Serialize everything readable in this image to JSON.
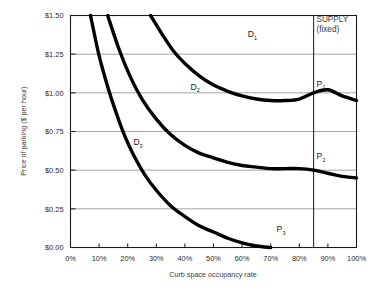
{
  "chart_data": {
    "type": "line",
    "title": "",
    "xlabel": "Curb space occupancy rate",
    "ylabel": "Price of parking ($ per hour)",
    "xlim": [
      0,
      100
    ],
    "ylim": [
      0.0,
      1.5
    ],
    "x_tick_labels": [
      "0%",
      "10%",
      "20%",
      "30%",
      "40%",
      "50%",
      "60%",
      "70%",
      "80%",
      "90%",
      "100%"
    ],
    "x_tick_values": [
      0,
      10,
      20,
      30,
      40,
      50,
      60,
      70,
      80,
      90,
      100
    ],
    "y_tick_labels": [
      "$0.00",
      "$0.25",
      "$0.50",
      "$0.75",
      "$1.00",
      "$1.25",
      "$1.50"
    ],
    "y_tick_values": [
      0.0,
      0.25,
      0.5,
      0.75,
      1.0,
      1.25,
      1.5
    ],
    "grid": true,
    "legend_position": "inline-labels",
    "series": [
      {
        "name": "D1",
        "label": "D",
        "subscript": "1",
        "label_x": 62,
        "label_y": 1.36,
        "points": [
          [
            28,
            1.5
          ],
          [
            32,
            1.38
          ],
          [
            36,
            1.27
          ],
          [
            40,
            1.19
          ],
          [
            45,
            1.11
          ],
          [
            50,
            1.05
          ],
          [
            55,
            1.01
          ],
          [
            60,
            0.98
          ],
          [
            65,
            0.96
          ],
          [
            70,
            0.95
          ],
          [
            75,
            0.95
          ],
          [
            80,
            0.96
          ],
          [
            85,
            1.0
          ],
          [
            90,
            1.02
          ],
          [
            95,
            0.98
          ],
          [
            100,
            0.95
          ]
        ]
      },
      {
        "name": "D2",
        "label": "D",
        "subscript": "2",
        "label_x": 42,
        "label_y": 1.02,
        "points": [
          [
            13,
            1.5
          ],
          [
            17,
            1.28
          ],
          [
            21,
            1.1
          ],
          [
            25,
            0.96
          ],
          [
            30,
            0.83
          ],
          [
            35,
            0.73
          ],
          [
            40,
            0.66
          ],
          [
            45,
            0.61
          ],
          [
            50,
            0.58
          ],
          [
            55,
            0.55
          ],
          [
            60,
            0.53
          ],
          [
            65,
            0.52
          ],
          [
            70,
            0.51
          ],
          [
            75,
            0.51
          ],
          [
            80,
            0.51
          ],
          [
            85,
            0.5
          ],
          [
            90,
            0.48
          ],
          [
            95,
            0.46
          ],
          [
            100,
            0.45
          ]
        ]
      },
      {
        "name": "D3",
        "label": "D",
        "subscript": "3",
        "label_x": 22,
        "label_y": 0.66,
        "points": [
          [
            7,
            1.5
          ],
          [
            10,
            1.24
          ],
          [
            13,
            1.04
          ],
          [
            16,
            0.87
          ],
          [
            19,
            0.72
          ],
          [
            22,
            0.6
          ],
          [
            26,
            0.47
          ],
          [
            30,
            0.37
          ],
          [
            35,
            0.27
          ],
          [
            40,
            0.2
          ],
          [
            45,
            0.14
          ],
          [
            50,
            0.1
          ],
          [
            55,
            0.06
          ],
          [
            60,
            0.03
          ],
          [
            65,
            0.01
          ],
          [
            70,
            0.0
          ]
        ]
      }
    ],
    "supply": {
      "label_line1": "SUPPLY",
      "label_line2": "(fixed)",
      "value": 85,
      "label_x": 86,
      "label_y": 1.46
    },
    "annotations": [
      {
        "name": "P1",
        "label": "P",
        "subscript": "1",
        "x": 86,
        "y": 1.04,
        "marker_x": 85,
        "marker_y": 1.0
      },
      {
        "name": "P2",
        "label": "P",
        "subscript": "2",
        "x": 86,
        "y": 0.57,
        "marker_x": 85,
        "marker_y": 0.5
      },
      {
        "name": "P3",
        "label": "P",
        "subscript": "3",
        "x": 72,
        "y": 0.1,
        "marker_x": 70,
        "marker_y": 0.0
      }
    ]
  }
}
